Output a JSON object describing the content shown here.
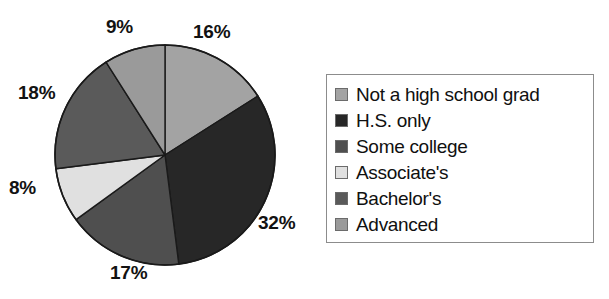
{
  "chart_data": {
    "type": "pie",
    "title": "",
    "subtitle": "",
    "xlabel": "",
    "ylabel": "",
    "categories": [
      "Not a high school grad",
      "H.S. only",
      "Some college",
      "Associate's",
      "Bachelor's",
      "Advanced"
    ],
    "values": [
      16,
      32,
      17,
      8,
      18,
      9
    ],
    "data_labels": [
      "16%",
      "32%",
      "17%",
      "8%",
      "18%",
      "9%"
    ],
    "unit": "%",
    "slice_colors": [
      "#a3a3a3",
      "#272727",
      "#4f4f4f",
      "#e0e0e0",
      "#5a5a5a",
      "#9a9a9a"
    ],
    "start_angle_deg": 0,
    "direction": "clockwise",
    "legend_position": "right",
    "grid": false
  },
  "pie": {
    "slices": [
      {
        "label": "Not a high school grad",
        "value": 16,
        "data_label": "16%",
        "color": "#a3a3a3"
      },
      {
        "label": "H.S. only",
        "value": 32,
        "data_label": "32%",
        "color": "#272727"
      },
      {
        "label": "Some college",
        "value": 17,
        "data_label": "17%",
        "color": "#4f4f4f"
      },
      {
        "label": "Associate's",
        "value": 8,
        "data_label": "8%",
        "color": "#e0e0e0"
      },
      {
        "label": "Bachelor's",
        "value": 18,
        "data_label": "18%",
        "color": "#5a5a5a"
      },
      {
        "label": "Advanced",
        "value": 9,
        "data_label": "9%",
        "color": "#9a9a9a"
      }
    ],
    "outline_color": "#1a1a1a"
  },
  "legend": {
    "border_color": "#8c8c8c",
    "items": [
      {
        "label": "Not a high school grad",
        "color": "#a3a3a3"
      },
      {
        "label": "H.S. only",
        "color": "#272727"
      },
      {
        "label": "Some college",
        "color": "#4f4f4f"
      },
      {
        "label": "Associate's",
        "color": "#e0e0e0"
      },
      {
        "label": "Bachelor's",
        "color": "#5a5a5a"
      },
      {
        "label": "Advanced",
        "color": "#9a9a9a"
      }
    ]
  },
  "labels": {
    "pct_16": "16%",
    "pct_32": "32%",
    "pct_17": "17%",
    "pct_8": "8%",
    "pct_18": "18%",
    "pct_9": "9%"
  }
}
